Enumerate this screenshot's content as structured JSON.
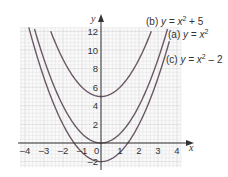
{
  "chart_data": {
    "type": "line",
    "title": "",
    "xlabel": "x",
    "ylabel": "y",
    "xlim": [
      -4.25,
      4.2
    ],
    "ylim": [
      -2.6,
      12.4
    ],
    "grid": true,
    "x_ticks": [
      -4,
      -3,
      -2,
      -1,
      0,
      1,
      2,
      3,
      4
    ],
    "x_tick_labels": [
      "–4",
      "–3",
      "–2",
      "–1",
      "0",
      "1",
      "2",
      "3",
      "4"
    ],
    "y_ticks": [
      -2,
      2,
      4,
      6,
      8,
      10,
      12
    ],
    "y_tick_labels": [
      "–2",
      "2",
      "4",
      "6",
      "8",
      "10",
      "12"
    ],
    "series": [
      {
        "name": "(b) y = x² + 5",
        "label_prefix": "(b) ",
        "expr_base": "y = x",
        "exp": "2",
        "expr_tail": " + 5",
        "offset": 5,
        "x": [
          -2.65,
          -2,
          -1,
          0,
          1,
          2,
          2.65
        ],
        "y": [
          12.0,
          9,
          6,
          5,
          6,
          9,
          12.0
        ]
      },
      {
        "name": "(a) y = x²",
        "label_prefix": "(a) ",
        "expr_base": "y = x",
        "exp": "2",
        "expr_tail": "",
        "offset": 0,
        "x": [
          -3.5,
          -3,
          -2,
          -1,
          0,
          1,
          2,
          3,
          3.5
        ],
        "y": [
          12.25,
          9,
          4,
          1,
          0,
          1,
          4,
          9,
          12.25
        ]
      },
      {
        "name": "(c) y = x² – 2",
        "label_prefix": "(c) ",
        "expr_base": "y = x",
        "exp": "2",
        "expr_tail": " – 2",
        "offset": -2,
        "x": [
          -3.8,
          -3,
          -2,
          -1,
          0,
          1,
          2,
          3,
          3.6
        ],
        "y": [
          12.44,
          7,
          2,
          -1,
          -2,
          -1,
          2,
          7,
          10.96
        ]
      }
    ],
    "legend_position": "annotations at upper right of each curve",
    "colors": {
      "curve": "#6b5866",
      "axis": "#333333",
      "grid_minor": "#e4e4e4",
      "grid_major": "#d2d2d2",
      "text": "#333333"
    }
  }
}
